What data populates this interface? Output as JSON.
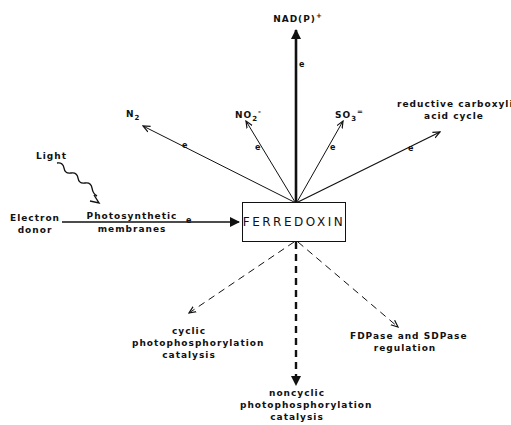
{
  "diagram": {
    "center": {
      "label": "FERREDOXIN"
    },
    "inputs": {
      "light": "Light",
      "donor_line1": "Electron",
      "donor_line2": "donor",
      "membranes_line1": "Photosynthetic",
      "membranes_line2": "membranes"
    },
    "outputs": {
      "nadp": {
        "base": "NAD(P)",
        "sup": "+"
      },
      "n2": {
        "base": "N",
        "sub": "2"
      },
      "no2": {
        "base": "NO",
        "sub": "2",
        "sup": "-"
      },
      "so3": {
        "base": "SO",
        "sub": "3",
        "sup": "="
      },
      "carboxylic_line1": "reductive carboxylic",
      "carboxylic_line2": "acid cycle"
    },
    "regulated": {
      "cyclic_line1": "cyclic",
      "cyclic_line2": "photophosphorylation",
      "cyclic_line3": "catalysis",
      "noncyclic_line1": "noncyclic",
      "noncyclic_line2": "photophosphorylation",
      "noncyclic_line3": "catalysis",
      "fdpase_line1": "FDPase and SDPase",
      "fdpase_line2": "regulation"
    },
    "electron_marker": "e",
    "colors": {
      "ink": "#111111",
      "background": "#ffffff"
    }
  }
}
